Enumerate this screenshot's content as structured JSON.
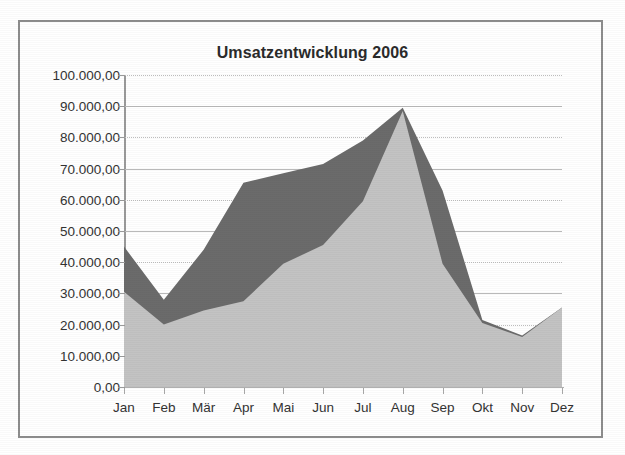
{
  "chart_data": {
    "type": "area",
    "title": "Umsatzentwicklung 2006",
    "subtitle": "",
    "xlabel": "",
    "ylabel": "",
    "stacked": false,
    "grid": true,
    "legend": "none",
    "ylim": [
      0,
      100000
    ],
    "ytick_step": 10000,
    "categories": [
      "Jan",
      "Feb",
      "Mär",
      "Apr",
      "Mai",
      "Jun",
      "Jul",
      "Aug",
      "Sep",
      "Okt",
      "Nov",
      "Dez"
    ],
    "ytick_labels": [
      "0,00",
      "10.000,00",
      "20.000,00",
      "30.000,00",
      "40.000,00",
      "50.000,00",
      "60.000,00",
      "70.000,00",
      "80.000,00",
      "90.000,00",
      "100.000,00"
    ],
    "ytick_values": [
      0,
      10000,
      20000,
      30000,
      40000,
      50000,
      60000,
      70000,
      80000,
      90000,
      100000
    ],
    "series": [
      {
        "name": "Serie 1",
        "color": "#6b6b6b",
        "values": [
          45000,
          28000,
          44000,
          65500,
          68500,
          71500,
          79000,
          89500,
          63000,
          21500,
          16500,
          25500
        ]
      },
      {
        "name": "Serie 2",
        "color": "#c3c3c3",
        "values": [
          30500,
          20000,
          24500,
          27500,
          39500,
          45500,
          59500,
          88500,
          39500,
          20500,
          16000,
          25500
        ]
      }
    ],
    "colors": {
      "series_dark": "#6b6b6b",
      "series_light": "#c3c3c3",
      "grid": "#b9b9b9",
      "axis": "#9a9a9a",
      "text": "#333333",
      "title": "#2b2b2b",
      "frame": "#8d8d8d",
      "background": "#ffffff"
    }
  }
}
